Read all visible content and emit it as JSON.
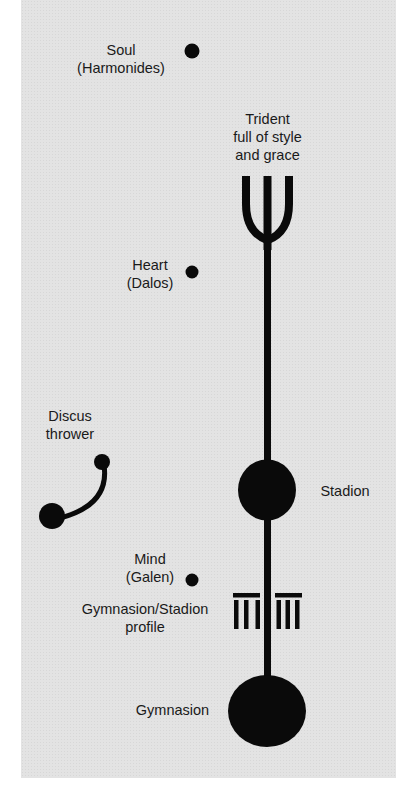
{
  "diagram": {
    "background_color": "#e3e3e3",
    "ink_color": "#0a0a0a",
    "labels": {
      "soul": "Soul\n(Harmonides)",
      "trident": "Trident\nfull of style\nand grace",
      "heart": "Heart\n(Dalos)",
      "discus": "Discus\nthrower",
      "stadion": "Stadion",
      "mind": "Mind\n(Galen)",
      "profile": "Gymnasion/Stadion\nprofile",
      "gymnasion": "Gymnasion"
    }
  }
}
